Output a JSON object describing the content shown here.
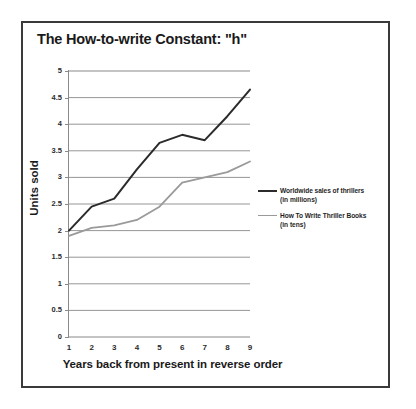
{
  "chart_data": {
    "type": "line",
    "title": "The How-to-write Constant: \"h\"",
    "xlabel": "Years back from present in reverse order",
    "ylabel": "Units sold",
    "x": [
      1,
      2,
      3,
      4,
      5,
      6,
      7,
      8,
      9
    ],
    "categories": [
      "1",
      "2",
      "3",
      "4",
      "5",
      "6",
      "7",
      "8",
      "9"
    ],
    "xlim": [
      1,
      9
    ],
    "ylim": [
      0,
      5
    ],
    "yticks": [
      "0",
      "0.5",
      "1",
      "1.5",
      "2",
      "2.5",
      "3",
      "3.5",
      "4",
      "4.5",
      "5"
    ],
    "ytick_values": [
      0,
      0.5,
      1,
      1.5,
      2,
      2.5,
      3,
      3.5,
      4,
      4.5,
      5
    ],
    "grid": "horizontal",
    "legend_position": "right",
    "series": [
      {
        "name": "Worldwide sales of thrillers",
        "sub": "(in millions)",
        "color": "#2b2b2b",
        "values": [
          2.0,
          2.45,
          2.6,
          3.15,
          3.65,
          3.8,
          3.7,
          4.15,
          4.65
        ]
      },
      {
        "name": "How To Write Thriller Books",
        "sub": "(in tens)",
        "color": "#9a9a9a",
        "values": [
          1.9,
          2.05,
          2.1,
          2.2,
          2.45,
          2.9,
          3.0,
          3.1,
          3.3
        ]
      }
    ]
  },
  "legend": {
    "entries": [
      {
        "label": "Worldwide sales of thrillers",
        "sub": "(in millions)"
      },
      {
        "label": "How To Write Thriller Books",
        "sub": "(in tens)"
      }
    ]
  },
  "colors": {
    "series_dark": "#2b2b2b",
    "series_gray": "#9a9a9a",
    "gridline": "#8a8a8a",
    "frame": "#3a3a3a",
    "text": "#1a1a1a",
    "background": "#ffffff"
  }
}
